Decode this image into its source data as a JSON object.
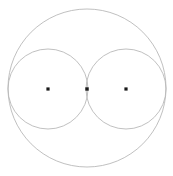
{
  "figure": {
    "width": 173,
    "height": 176,
    "background_color": "#ffffff",
    "stroke_color": "#b9b9b9",
    "stroke_width": 0.9,
    "dot_color": "#1a1a1a"
  },
  "chart_data": {
    "type": "scatter",
    "title": "",
    "xlabel": "",
    "ylabel": "",
    "xlim": [
      0,
      173
    ],
    "ylim": [
      0,
      176
    ],
    "grid": false,
    "legend": "none",
    "shapes": [
      {
        "name": "outer-circle",
        "kind": "circle",
        "cx": 87,
        "cy": 88,
        "r": 79,
        "stroke": "#b9b9b9",
        "fill": "none"
      },
      {
        "name": "left-circle",
        "kind": "circle",
        "cx": 48,
        "cy": 89,
        "r": 40,
        "stroke": "#b9b9b9",
        "fill": "none"
      },
      {
        "name": "right-circle",
        "kind": "circle",
        "cx": 126,
        "cy": 89,
        "r": 40,
        "stroke": "#b9b9b9",
        "fill": "none"
      }
    ],
    "points": [
      {
        "name": "left-center-point",
        "x": 48,
        "y": 89,
        "size": 3.2,
        "color": "#1a1a1a"
      },
      {
        "name": "middle-tangent-point",
        "x": 87,
        "y": 89,
        "size": 3.4,
        "color": "#1a1a1a"
      },
      {
        "name": "right-center-point",
        "x": 126,
        "y": 89,
        "size": 3.2,
        "color": "#1a1a1a"
      }
    ]
  }
}
